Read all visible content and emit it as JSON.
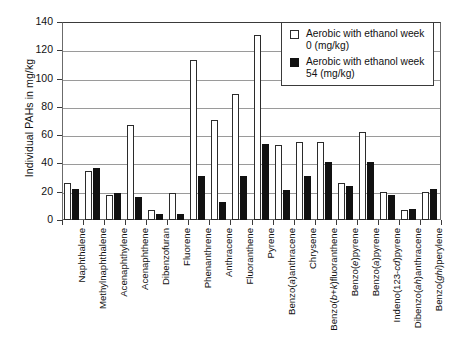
{
  "chart_data": {
    "type": "bar",
    "title": "",
    "xlabel": "",
    "ylabel": "Individual PAHs in mg/kg",
    "ylim": [
      0,
      140
    ],
    "ytick_step": 20,
    "yticks": [
      "0",
      "20",
      "40",
      "60",
      "80",
      "100",
      "120",
      "140"
    ],
    "grid": "horizontal",
    "legend_position": "top-right",
    "categories": [
      "Naphthalene",
      "Methylnaphthalene",
      "Acenaphthylene",
      "Acenaphthene",
      "Dibenzofuran",
      "Fluorene",
      "Phenanthrene",
      "Anthracene",
      "Fluoranthene",
      "Pyrene",
      "Benzo(a)anthracene",
      "Chrysene",
      "Benzo(b+k)fluoranthene",
      "Benzo(e)pyrene",
      "Benzo(a)pyrene",
      "Indeno(123-cd)pyrene",
      "Dibenzo(ah)anthracene",
      "Benzo(ghi)perylene"
    ],
    "series": [
      {
        "name": "Aerobic with ethanol week 0 (mg/kg)",
        "color": "#ffffff",
        "edge_color": "#2b2b2b",
        "values": [
          26,
          35,
          18,
          67,
          7,
          19,
          113,
          71,
          89,
          131,
          53,
          55,
          55,
          26,
          62,
          20,
          7,
          20
        ]
      },
      {
        "name": "Aerobic with ethanol week 54 (mg/kg)",
        "color": "#111111",
        "edge_color": "#111111",
        "values": [
          22,
          37,
          19,
          16,
          4,
          4,
          31,
          13,
          31,
          54,
          21,
          31,
          41,
          24,
          41,
          18,
          8,
          22
        ]
      }
    ]
  },
  "legend": {
    "items": [
      {
        "label": "Aerobic with ethanol week 0 (mg/kg)",
        "swatch": "open-square-icon"
      },
      {
        "label": "Aerobic with ethanol week 54 (mg/kg)",
        "swatch": "filled-square-icon"
      }
    ]
  }
}
